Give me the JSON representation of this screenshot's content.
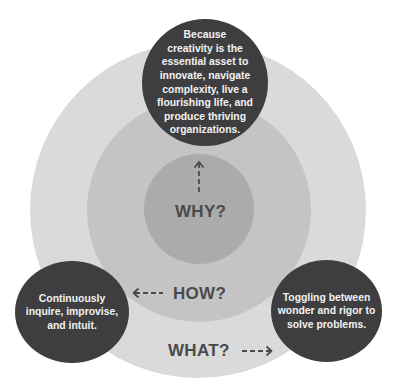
{
  "diagram": {
    "type": "concentric-circles",
    "colors": {
      "outer_ring": "#dadada",
      "middle_ring": "#c4c4c4",
      "inner_ring": "#ababab",
      "bubble": "#3e3e40",
      "bubble_text": "#f2f2f2",
      "label_text": "#4a4a4c"
    },
    "rings": [
      {
        "id": "why",
        "label": "WHY?",
        "arrow": "arrow-up",
        "level": "inner"
      },
      {
        "id": "how",
        "label": "HOW?",
        "arrow": "arrow-left",
        "level": "middle"
      },
      {
        "id": "what",
        "label": "WHAT?",
        "arrow": "arrow-right",
        "level": "outer"
      }
    ],
    "bubbles": {
      "why": "Because\ncreativity is the\nessential asset to\ninnovate, navigate\ncomplexity, live a\nflourishing life, and\nproduce thriving\norganizations.",
      "how": "Continuously\ninquire, improvise,\nand intuit.",
      "what": "Toggling between\nwonder and rigor to\nsolve problems."
    }
  }
}
